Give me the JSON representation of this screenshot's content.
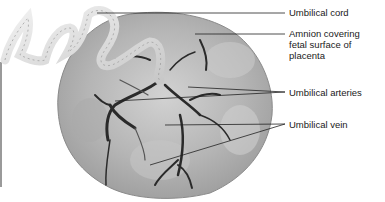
{
  "figure": {
    "labels": [
      {
        "id": "umbilical-cord",
        "text": "Umbilical cord",
        "x": 289,
        "y": 7
      },
      {
        "id": "amnion",
        "text": "Amnion covering\nfetal surface of\nplacenta",
        "x": 289,
        "y": 27
      },
      {
        "id": "umbilical-arteries",
        "text": "Umbilical arteries",
        "x": 289,
        "y": 88
      },
      {
        "id": "umbilical-vein",
        "text": "Umbilical vein",
        "x": 289,
        "y": 120
      }
    ],
    "colors": {
      "background": "#ffffff",
      "text": "#1a1a1a",
      "leader": "#222222",
      "disc": "#b8b8b8",
      "vessels": "#2a2a2a",
      "cord": "#e6e6e6"
    }
  }
}
